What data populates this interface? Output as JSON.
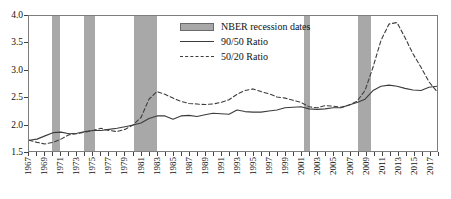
{
  "chart_data": {
    "type": "line",
    "title": "",
    "xlabel": "",
    "ylabel": "",
    "ylim": [
      1.5,
      4.0
    ],
    "yticks": [
      "1.5",
      "2.0",
      "2.5",
      "3.0",
      "3.5",
      "4.0"
    ],
    "xlim": [
      1967,
      2018
    ],
    "grid": false,
    "legend_position": "top-center",
    "legend": [
      {
        "label": "NBER recession dates",
        "style": "shaded-band",
        "color": "#a8a8a8"
      },
      {
        "label": "90/50 Ratio",
        "style": "solid",
        "color": "#3c3c3c"
      },
      {
        "label": "50/20 Ratio",
        "style": "dashed",
        "color": "#3c3c3c"
      }
    ],
    "xticklabels": [
      "1967",
      "1969",
      "1971",
      "1973",
      "1975",
      "1977",
      "1979",
      "1981",
      "1983",
      "1985",
      "1987",
      "1989",
      "1991",
      "1993",
      "1995",
      "1997",
      "1999",
      "2001",
      "2003",
      "2005",
      "2007",
      "2009",
      "2011",
      "2013",
      "2015",
      "2017"
    ],
    "x": [
      1967,
      1968,
      1969,
      1970,
      1971,
      1972,
      1973,
      1974,
      1975,
      1976,
      1977,
      1978,
      1979,
      1980,
      1981,
      1982,
      1983,
      1984,
      1985,
      1986,
      1987,
      1988,
      1989,
      1990,
      1991,
      1992,
      1993,
      1994,
      1995,
      1996,
      1997,
      1998,
      1999,
      2000,
      2001,
      2002,
      2003,
      2004,
      2005,
      2006,
      2007,
      2008,
      2009,
      2010,
      2011,
      2012,
      2013,
      2014,
      2015,
      2016,
      2017,
      2018
    ],
    "series": [
      {
        "name": "90/50 Ratio",
        "style": "solid",
        "color": "#3c3c3c",
        "values": [
          1.7,
          1.72,
          1.78,
          1.84,
          1.85,
          1.82,
          1.83,
          1.86,
          1.88,
          1.88,
          1.9,
          1.92,
          1.95,
          1.98,
          2.02,
          2.1,
          2.15,
          2.15,
          2.09,
          2.15,
          2.16,
          2.14,
          2.17,
          2.2,
          2.19,
          2.18,
          2.26,
          2.23,
          2.22,
          2.22,
          2.24,
          2.26,
          2.3,
          2.31,
          2.32,
          2.28,
          2.27,
          2.28,
          2.3,
          2.3,
          2.35,
          2.4,
          2.46,
          2.62,
          2.7,
          2.72,
          2.7,
          2.66,
          2.63,
          2.62,
          2.68,
          2.7
        ]
      },
      {
        "name": "50/20 Ratio",
        "style": "dashed",
        "color": "#3c3c3c",
        "values": [
          1.7,
          1.66,
          1.63,
          1.66,
          1.72,
          1.8,
          1.82,
          1.85,
          1.88,
          1.92,
          1.88,
          1.86,
          1.9,
          1.98,
          2.12,
          2.46,
          2.6,
          2.55,
          2.48,
          2.42,
          2.38,
          2.37,
          2.36,
          2.37,
          2.4,
          2.45,
          2.55,
          2.62,
          2.65,
          2.6,
          2.56,
          2.5,
          2.48,
          2.44,
          2.4,
          2.32,
          2.3,
          2.34,
          2.33,
          2.31,
          2.35,
          2.42,
          2.62,
          3.05,
          3.55,
          3.85,
          3.88,
          3.6,
          3.3,
          3.05,
          2.78,
          2.6
        ]
      }
    ],
    "recession_bands": [
      {
        "start": 1969.9,
        "end": 1970.9
      },
      {
        "start": 1973.9,
        "end": 1975.2
      },
      {
        "start": 1980.0,
        "end": 1982.9
      },
      {
        "start": 2001.2,
        "end": 2001.9
      },
      {
        "start": 2007.9,
        "end": 2009.5
      }
    ]
  }
}
